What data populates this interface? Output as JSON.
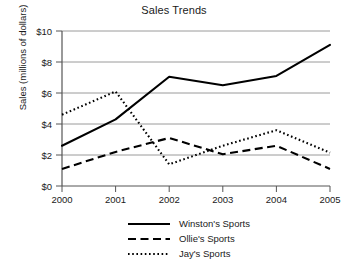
{
  "chart_data": {
    "type": "line",
    "title": "Sales Trends",
    "xlabel": "",
    "ylabel": "Sales (millions of dollars)",
    "x": [
      "2000",
      "2001",
      "2002",
      "2003",
      "2004",
      "2005"
    ],
    "xtick_labels": [
      "2000",
      "2001",
      "2002",
      "2003",
      "2004",
      "2005"
    ],
    "ytick_labels": [
      "$0",
      "$2",
      "$4",
      "$6",
      "$8",
      "$10"
    ],
    "ytick_values": [
      0,
      2,
      4,
      6,
      8,
      10
    ],
    "ylim": [
      0,
      10
    ],
    "grid": "horizontal",
    "legend_position": "bottom-center",
    "series": [
      {
        "name": "Winston's Sports",
        "style": "solid",
        "color": "#000000",
        "values": [
          2.6,
          4.3,
          7.05,
          6.5,
          7.1,
          9.1
        ]
      },
      {
        "name": "Ollie's Sports",
        "style": "dashed",
        "color": "#000000",
        "values": [
          1.1,
          2.2,
          3.1,
          2.05,
          2.6,
          1.1
        ]
      },
      {
        "name": "Jay's Sports",
        "style": "dotted",
        "color": "#000000",
        "values": [
          4.6,
          6.1,
          1.4,
          2.6,
          3.6,
          2.15
        ]
      }
    ]
  },
  "axis": {
    "y_labels": {
      "t0": "$0",
      "t1": "$2",
      "t2": "$4",
      "t3": "$6",
      "t4": "$8",
      "t5": "$10"
    },
    "x_labels": {
      "t0": "2000",
      "t1": "2001",
      "t2": "2002",
      "t3": "2003",
      "t4": "2004",
      "t5": "2005"
    }
  },
  "legend": {
    "items": [
      {
        "label": "Winston's Sports",
        "style": "solid"
      },
      {
        "label": "Ollie's Sports",
        "style": "dashed"
      },
      {
        "label": "Jay's Sports",
        "style": "dotted"
      }
    ]
  },
  "colors": {
    "line": "#000000",
    "grid": "#9a9a9a",
    "axis": "#555555",
    "text": "#1a1a1a",
    "background": "#ffffff"
  }
}
